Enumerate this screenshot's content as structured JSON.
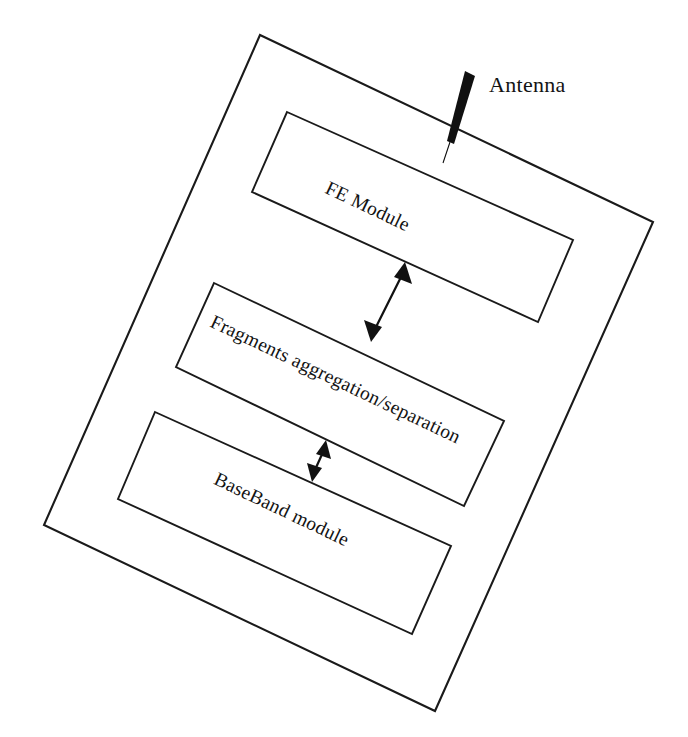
{
  "diagram": {
    "orientation_degrees": 25.4,
    "stroke_color": "#1a1a1a",
    "background_color": "#ffffff",
    "outer_container": {
      "name": "device-enclosure",
      "label": ""
    },
    "blocks": [
      {
        "id": "fe-module",
        "label": "FE Module",
        "order": 1
      },
      {
        "id": "fragments-aggregation-separation",
        "label": "Fragments aggregation/separation",
        "order": 2
      },
      {
        "id": "baseband-module",
        "label": "BaseBand module",
        "order": 3
      }
    ],
    "annotations": [
      {
        "id": "antenna",
        "label": "Antenna",
        "kind": "antenna-element",
        "attached_to": "fe-module"
      }
    ],
    "connectors": [
      {
        "id": "fe-to-fragments",
        "from": "fragments-aggregation-separation",
        "to": "fe-module",
        "style": "double-headed-arrow",
        "label": ""
      },
      {
        "id": "fragments-to-baseband",
        "from": "baseband-module",
        "to": "fragments-aggregation-separation",
        "style": "double-headed-arrow",
        "label": ""
      }
    ]
  }
}
